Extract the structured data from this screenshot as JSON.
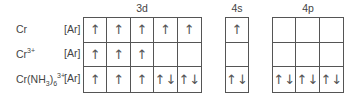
{
  "headers": {
    "d": "3d",
    "s": "4s",
    "p": "4p"
  },
  "core": "[Ar]",
  "rows": [
    {
      "species": "Cr",
      "sup": "",
      "d": [
        "↑",
        "↑",
        "↑",
        "↑",
        "↑"
      ],
      "s": [
        "↑"
      ],
      "p": [
        "",
        "",
        ""
      ]
    },
    {
      "species": "Cr",
      "sup": "3+",
      "d": [
        "↑",
        "↑",
        "↑",
        "",
        ""
      ],
      "s": [
        ""
      ],
      "p": [
        "",
        "",
        ""
      ]
    },
    {
      "species": "Cr(NH",
      "sub": "3",
      "mid": ")",
      "sub2": "6",
      "sup": "3+",
      "d": [
        "↑",
        "↑",
        "↑",
        "↑↓",
        "↑↓"
      ],
      "s": [
        "↑↓"
      ],
      "p": [
        "↑↓",
        "↑↓",
        "↑↓"
      ]
    }
  ]
}
